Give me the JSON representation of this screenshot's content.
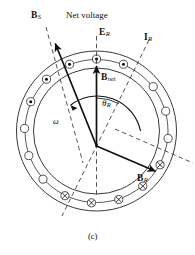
{
  "figure": {
    "caption": "(c)",
    "title_text": "Net voltage"
  },
  "labels": {
    "net_voltage": "Net voltage",
    "b_s": {
      "name": "B",
      "sub": "S"
    },
    "e_r": {
      "name": "E",
      "sub": "R"
    },
    "i_r": {
      "name": "I",
      "sub": "R"
    },
    "b_net": {
      "name": "B",
      "sub": "net"
    },
    "b_r": {
      "name": "B",
      "sub": "R"
    },
    "theta_r": {
      "name": "θ",
      "sub": "R"
    },
    "omega": "ω"
  },
  "colors": {
    "ink": "#111111",
    "line": "#333333",
    "background": "#ffffff"
  },
  "chart_data": {
    "type": "diagram",
    "title": "Net voltage",
    "center": {
      "x": 96.5,
      "y": 131
    },
    "rings": {
      "outer_radius": 80,
      "mid_radius": 72,
      "inner_radius": 63
    },
    "vector_origin": {
      "x": 96.5,
      "y": 146
    },
    "vectors": [
      {
        "label": "B_net",
        "angle_deg": 90,
        "length": 84,
        "style": "solid"
      },
      {
        "label": "B_R",
        "angle_deg": -22,
        "length": 68,
        "style": "solid"
      },
      {
        "label": "B_S",
        "angle_deg": 118,
        "length": 128,
        "style": "solid"
      }
    ],
    "axes": [
      {
        "label": "E_R",
        "angle_deg": 90,
        "style": "dashed"
      },
      {
        "label": "I_R",
        "angle_deg": 62,
        "style": "dashed"
      },
      {
        "label": "B_R",
        "angle_deg": -22,
        "style": "dashed"
      },
      {
        "label": "B_S",
        "angle_deg": 118,
        "style": "dashed"
      }
    ],
    "angle_arc": {
      "label": "theta_R",
      "from_deg": 62,
      "to_deg": 90
    },
    "rotation": {
      "label": "omega",
      "direction": "counterclockwise"
    },
    "slots": [
      {
        "index": 0,
        "angle_deg": 90,
        "marker": "dot"
      },
      {
        "index": 1,
        "angle_deg": 112,
        "marker": "dot"
      },
      {
        "index": 2,
        "angle_deg": 134,
        "marker": "dot"
      },
      {
        "index": 3,
        "angle_deg": 156,
        "marker": "dot"
      },
      {
        "index": 4,
        "angle_deg": 178,
        "marker": "empty"
      },
      {
        "index": 5,
        "angle_deg": 200,
        "marker": "empty"
      },
      {
        "index": 6,
        "angle_deg": 222,
        "marker": "empty"
      },
      {
        "index": 7,
        "angle_deg": 244,
        "marker": "cross"
      },
      {
        "index": 8,
        "angle_deg": 266,
        "marker": "cross"
      },
      {
        "index": 9,
        "angle_deg": 288,
        "marker": "cross"
      },
      {
        "index": 10,
        "angle_deg": 310,
        "marker": "cross"
      },
      {
        "index": 11,
        "angle_deg": 332,
        "marker": "cross"
      },
      {
        "index": 12,
        "angle_deg": 354,
        "marker": "empty"
      },
      {
        "index": 13,
        "angle_deg": 16,
        "marker": "empty"
      },
      {
        "index": 14,
        "angle_deg": 38,
        "marker": "empty"
      },
      {
        "index": 15,
        "angle_deg": 68,
        "marker": "dot"
      }
    ],
    "marker_legend": {
      "dot": "current out of page",
      "cross": "current into page",
      "empty": "no current"
    }
  }
}
